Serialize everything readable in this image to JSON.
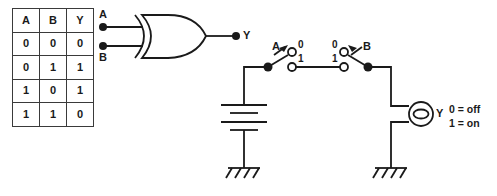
{
  "diagram": {
    "stroke_color": "#1a1a1a",
    "background_color": "#ffffff"
  },
  "truth_table": {
    "name": "xor-truth-table",
    "headers": [
      "A",
      "B",
      "Y"
    ],
    "rows": [
      [
        "0",
        "0",
        "0"
      ],
      [
        "0",
        "1",
        "1"
      ],
      [
        "1",
        "0",
        "1"
      ],
      [
        "1",
        "1",
        "0"
      ]
    ]
  },
  "gate": {
    "name": "xor-gate",
    "type": "XOR",
    "input_a_label": "A",
    "input_b_label": "B",
    "output_label": "Y"
  },
  "circuit": {
    "name": "switch-circuit",
    "battery_label": "",
    "switch_a": {
      "label": "A",
      "position_0_label": "0",
      "position_1_label": "1"
    },
    "switch_b": {
      "label": "B",
      "position_0_label": "0",
      "position_1_label": "1"
    },
    "lamp": {
      "label": "Y"
    },
    "legend": {
      "off_line": "0 = off",
      "on_line": "1 = on"
    }
  }
}
